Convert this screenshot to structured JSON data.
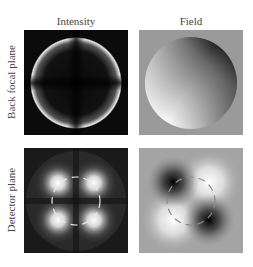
{
  "figure": {
    "columns": [
      {
        "title": "Intensity"
      },
      {
        "title": "Field"
      }
    ],
    "rows": [
      {
        "label": "Back focal plane"
      },
      {
        "label": "Detector plane"
      }
    ],
    "panels": [
      {
        "row": "Back focal plane",
        "column": "Intensity",
        "description": "bright ring at pupil edge on dark background"
      },
      {
        "row": "Back focal plane",
        "column": "Field",
        "description": "shaded disk with gradient on grey background"
      },
      {
        "row": "Detector plane",
        "column": "Intensity",
        "description": "four bright lobes with dashed circle overlay"
      },
      {
        "row": "Detector plane",
        "column": "Field",
        "description": "two dark and two bright lobes diagonally, dashed circle overlay"
      }
    ],
    "colors": {
      "background": "#ffffff",
      "dark_panel": "#0c0c0c",
      "grey_panel": "#9a9a9a",
      "text": "#444444"
    }
  }
}
